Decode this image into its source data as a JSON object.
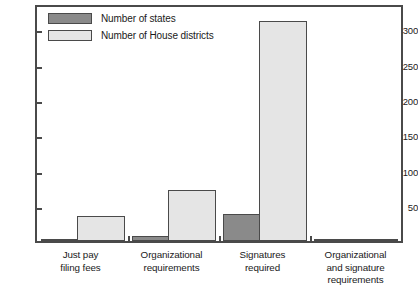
{
  "chart_data": {
    "type": "bar",
    "title": "",
    "subtitle": "",
    "xlabel": "",
    "ylabel": "",
    "ylim": [
      0,
      335
    ],
    "yticks": [
      50,
      100,
      150,
      200,
      250,
      300
    ],
    "ytick_labels": [
      "50",
      "100",
      "150",
      "200",
      "250",
      "300"
    ],
    "grid": false,
    "legend_position": "top-left",
    "categories": [
      "Just pay filing fees",
      "Organizational requirements",
      "Signatures required",
      "Organizational and signature requirements"
    ],
    "category_label_lines": [
      [
        "Just pay",
        "filing fees"
      ],
      [
        "Organizational",
        "requirements"
      ],
      [
        "Signatures",
        "required"
      ],
      [
        "Organizational",
        "and signature",
        "requirements"
      ]
    ],
    "series": [
      {
        "name": "Number of states",
        "color": "#8a8a8a",
        "values": [
          2,
          7,
          39,
          2
        ]
      },
      {
        "name": "Number of House districts",
        "color": "#e5e5e5",
        "values": [
          36,
          73,
          315,
          1
        ]
      }
    ]
  },
  "legend": {
    "items": [
      {
        "label": "Number of states",
        "color": "#8a8a8a"
      },
      {
        "label": "Number of House districts",
        "color": "#e5e5e5"
      }
    ]
  },
  "axis": {
    "line_color": "#4a4a4a",
    "bar_outline_color": "#4a4a4a"
  }
}
